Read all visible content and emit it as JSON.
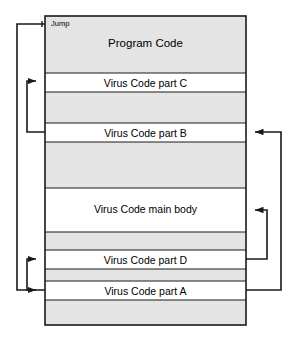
{
  "diagram": {
    "jump_label": "Jump",
    "colors": {
      "stroke": "#1a1a1a",
      "band_fill_shaded": "#e4e4e4",
      "band_fill_plain": "#ffffff",
      "background": "#ffffff",
      "text": "#000000"
    },
    "bands": [
      {
        "id": "program-code",
        "label": "Program Code",
        "fill": "shaded",
        "y": 16,
        "height": 57,
        "label_y": 38
      },
      {
        "id": "virus-code-part-c",
        "label": "Virus Code part C",
        "fill": "plain",
        "y": 73,
        "height": 19,
        "label_y": 78
      },
      {
        "id": "gap-1",
        "label": "",
        "fill": "shaded",
        "y": 92,
        "height": 31,
        "label_y": 0
      },
      {
        "id": "virus-code-part-b",
        "label": "Virus Code part B",
        "fill": "plain",
        "y": 123,
        "height": 19,
        "label_y": 128
      },
      {
        "id": "gap-2",
        "label": "",
        "fill": "shaded",
        "y": 142,
        "height": 46,
        "label_y": 0
      },
      {
        "id": "virus-code-main-body",
        "label": "Virus Code main body",
        "fill": "plain",
        "y": 188,
        "height": 44,
        "label_y": 204
      },
      {
        "id": "gap-3",
        "label": "",
        "fill": "shaded",
        "y": 232,
        "height": 18,
        "label_y": 0
      },
      {
        "id": "virus-code-part-d",
        "label": "Virus Code part D",
        "fill": "plain",
        "y": 250,
        "height": 19,
        "label_y": 255
      },
      {
        "id": "gap-4",
        "label": "",
        "fill": "shaded",
        "y": 269,
        "height": 12,
        "label_y": 0
      },
      {
        "id": "virus-code-part-a",
        "label": "Virus Code part A",
        "fill": "plain",
        "y": 281,
        "height": 19,
        "label_y": 286
      },
      {
        "id": "gap-5",
        "label": "",
        "fill": "shaded",
        "y": 300,
        "height": 25,
        "label_y": 0
      }
    ],
    "flows": [
      {
        "id": "jump-to-part-a",
        "from": "program-code-entry",
        "to": "virus-code-part-a",
        "side": "left",
        "label": "Jump"
      },
      {
        "id": "part-b-to-part-c",
        "from": "virus-code-part-b",
        "to": "virus-code-part-c",
        "side": "left",
        "label": ""
      },
      {
        "id": "part-a-to-part-d",
        "from": "virus-code-part-a",
        "to": "virus-code-part-d",
        "side": "left",
        "label": ""
      },
      {
        "id": "part-a-to-part-b",
        "from": "virus-code-part-a",
        "to": "virus-code-part-b",
        "side": "right",
        "label": ""
      },
      {
        "id": "part-d-to-main-body",
        "from": "virus-code-part-d",
        "to": "virus-code-main-body",
        "side": "right",
        "label": ""
      }
    ]
  }
}
